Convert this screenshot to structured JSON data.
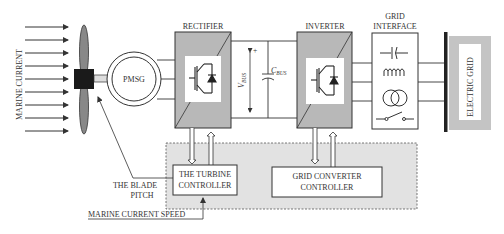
{
  "colors": {
    "block_fill": "#b8b8b8",
    "controller_area": "#e2e2e2",
    "blade_fill": "#888888",
    "hub_fill": "#1a1a1a",
    "line": "#333333",
    "grid_bar": "#222222"
  },
  "labels": {
    "marine_current": "MARINE CURRENT",
    "pmsg": "PMSG",
    "rectifier": "RECTIFIER",
    "inverter": "INVERTER",
    "grid_interface_line1": "GRID",
    "grid_interface_line2": "INTERFACE",
    "electric_grid": "ELECTRIC GRID",
    "vbus_main": "V",
    "vbus_sub": "BUS",
    "cbus_main": "C",
    "cbus_sub": "BUS",
    "plus": "+",
    "blade_pitch_line1": "THE BLADE",
    "blade_pitch_line2": "PITCH",
    "turbine_controller_line1": "THE TURBINE",
    "turbine_controller_line2": "CONTROLLER",
    "grid_converter_controller_line1": "GRID CONVERTER",
    "grid_converter_controller_line2": "CONTROLLER",
    "marine_current_speed": "MARINE CURRENT SPEED"
  },
  "grid_interface_components": [
    {
      "name": "capacitor",
      "icon": "capacitor-icon"
    },
    {
      "name": "inductor",
      "icon": "inductor-icon"
    },
    {
      "name": "transformer",
      "icon": "transformer-icon"
    },
    {
      "name": "switch",
      "icon": "switch-icon"
    }
  ]
}
